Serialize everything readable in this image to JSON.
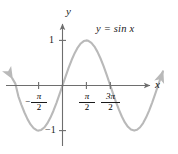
{
  "figure": {
    "kind": "graph-of-function",
    "equation_label": "y = sin x",
    "curve_color": "#b9b9b9",
    "axis_color": "#6e6e6e",
    "text_color": "#1a1a1a",
    "background": "#ffffff"
  },
  "axes": {
    "x_axis_name": "x",
    "y_axis_name": "y",
    "x_ticks": [
      {
        "label_sign": "−",
        "label_num": "π",
        "label_den": "2",
        "value": -1.5708,
        "text": "-π/2"
      },
      {
        "label_sign": "",
        "label_num": "π",
        "label_den": "2",
        "value": 1.5708,
        "text": "π/2"
      },
      {
        "label_sign": "",
        "label_num": "3π",
        "label_den": "2",
        "value": 4.7124,
        "text": "3π/2"
      }
    ],
    "y_ticks": [
      {
        "text": "1",
        "value": 1
      },
      {
        "text": "−1",
        "value": -1
      }
    ],
    "xlim": [
      -3.3,
      6.6
    ],
    "ylim": [
      -1.55,
      1.55
    ]
  },
  "chart_data": {
    "type": "line",
    "title": "",
    "subtitle": "",
    "xlabel": "x",
    "ylabel": "y",
    "xlim": [
      -3.3,
      6.6
    ],
    "ylim": [
      -1.55,
      1.55
    ],
    "grid": false,
    "legend": "none",
    "annotations": [
      {
        "text": "y = sin x",
        "x": 3.0,
        "y": 1.35
      }
    ],
    "series": [
      {
        "name": "y = sin x",
        "color": "#b9b9b9",
        "arrow_start": true,
        "arrow_end": true,
        "x": [
          -3.3,
          -3.1,
          -2.9,
          -2.7,
          -2.5,
          -2.3,
          -2.1,
          -1.9,
          -1.7,
          -1.5708,
          -1.4,
          -1.2,
          -1.0,
          -0.8,
          -0.6,
          -0.4,
          -0.2,
          0.0,
          0.2,
          0.4,
          0.6,
          0.8,
          1.0,
          1.2,
          1.4,
          1.5708,
          1.7,
          1.9,
          2.1,
          2.3,
          2.5,
          2.7,
          2.9,
          3.1416,
          3.3,
          3.5,
          3.7,
          3.9,
          4.1,
          4.3,
          4.5,
          4.7124,
          4.9,
          5.1,
          5.3,
          5.5,
          5.7,
          5.9,
          6.1,
          6.28,
          6.45,
          6.6
        ],
        "y": [
          0.1577,
          0.0416,
          -0.2392,
          -0.4274,
          -0.5985,
          -0.7457,
          -0.8632,
          -0.9463,
          -0.9917,
          -1.0,
          -0.9854,
          -0.932,
          -0.8415,
          -0.7174,
          -0.5646,
          -0.3894,
          -0.1987,
          0.0,
          0.1987,
          0.3894,
          0.5646,
          0.7174,
          0.8415,
          0.932,
          0.9854,
          1.0,
          0.9917,
          0.9463,
          0.8632,
          0.7457,
          0.5985,
          0.4274,
          0.2392,
          0.0,
          -0.1577,
          -0.3508,
          -0.5298,
          -0.6878,
          -0.8183,
          -0.9162,
          -0.9775,
          -1.0,
          -0.9825,
          -0.9258,
          -0.8323,
          -0.7055,
          -0.5507,
          -0.3739,
          -0.1822,
          0.0,
          0.1679,
          0.3115
        ]
      }
    ]
  }
}
